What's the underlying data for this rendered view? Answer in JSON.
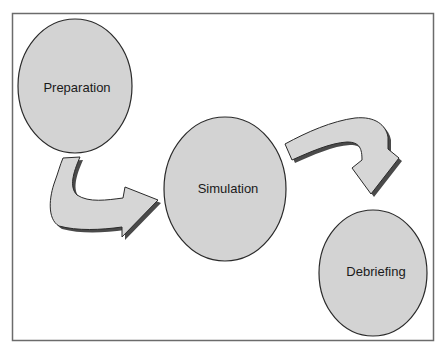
{
  "diagram": {
    "type": "process-flow",
    "colors": {
      "frame": "#6b6b6b",
      "node_fill": "#d3d3d3",
      "node_stroke": "#2a2a2a",
      "arrow_fill": "#d6d6d6",
      "arrow_stroke": "#2a2a2a",
      "arrow_shadow": "#4a4a4a"
    },
    "nodes": [
      {
        "id": "preparation",
        "label": "Preparation",
        "cx": 75,
        "cy": 86,
        "rx": 57,
        "ry": 67
      },
      {
        "id": "simulation",
        "label": "Simulation",
        "cx": 225,
        "cy": 189,
        "rx": 61,
        "ry": 72
      },
      {
        "id": "debriefing",
        "label": "Debriefing",
        "cx": 373,
        "cy": 273,
        "rx": 54,
        "ry": 63
      }
    ],
    "edges": [
      {
        "from": "preparation",
        "to": "simulation"
      },
      {
        "from": "simulation",
        "to": "debriefing"
      }
    ]
  }
}
